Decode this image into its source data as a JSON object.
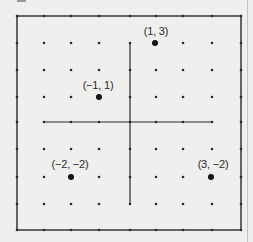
{
  "figure": {
    "partial_caption_mark": "",
    "frame": {
      "left": 17,
      "top": 16,
      "right": 241,
      "bottom": 230
    },
    "grid": {
      "x_pixels": [
        17,
        44,
        71,
        99,
        130,
        156,
        183,
        212,
        241
      ],
      "y_pixels": [
        16,
        43,
        70,
        97,
        122,
        149,
        177,
        204,
        230
      ],
      "x_values": [
        -4,
        -3,
        -2,
        -1,
        0,
        1,
        2,
        3,
        4
      ],
      "y_values": [
        4,
        3,
        2,
        1,
        0,
        -1,
        -2,
        -3,
        -4
      ]
    },
    "axes": {
      "horizontal": {
        "y": 122,
        "x_from": 44,
        "x_to": 212
      },
      "vertical": {
        "x": 130,
        "y_from": 43,
        "y_to": 204
      }
    },
    "colors": {
      "ink": "#2a2a2a",
      "background": "#efefed"
    }
  },
  "chart_data": {
    "type": "scatter",
    "title": "",
    "xlabel": "",
    "ylabel": "",
    "xlim": [
      -4,
      4
    ],
    "ylim": [
      -4,
      4
    ],
    "grid": "dot lattice at integer coordinates",
    "points": [
      {
        "x": 1,
        "y": 3,
        "label": "(1, 3)",
        "px": 155,
        "py": 43,
        "label_x": 156,
        "label_y": 25
      },
      {
        "x": -1,
        "y": 1,
        "label": "(−1, 1)",
        "px": 99,
        "py": 97,
        "label_x": 98,
        "label_y": 79
      },
      {
        "x": -2,
        "y": -2,
        "label": "(−2, −2)",
        "px": 71,
        "py": 177,
        "label_x": 70,
        "label_y": 158
      },
      {
        "x": 3,
        "y": -2,
        "label": "(3, −2)",
        "px": 211,
        "py": 177,
        "label_x": 213,
        "label_y": 158
      }
    ]
  }
}
